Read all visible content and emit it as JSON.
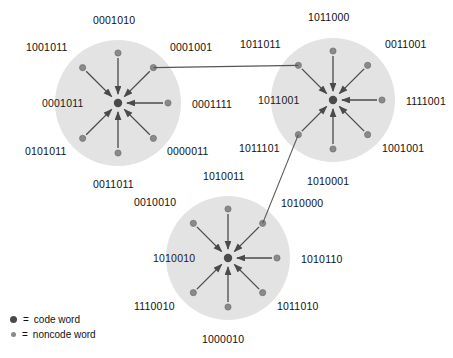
{
  "figure": {
    "colors": {
      "sphere_fill": "#e2e2e2",
      "codeword_dot": "#4a4a4a",
      "noncode_dot": "#8a8a8a",
      "arrow": "#4a4a4a",
      "link_line": "#555555",
      "text": "#111111"
    }
  },
  "spheres": [
    {
      "id": "sphere-1",
      "center_label": "0001011",
      "center_label_pos": {
        "x": 42,
        "y": 97
      },
      "cx": 118,
      "cy": 103,
      "r": 63,
      "neighbors": [
        {
          "bits": "0001010",
          "angle": -90,
          "label_x": 93,
          "label_y": 14,
          "label_align": "left"
        },
        {
          "bits": "0001001",
          "angle": -45,
          "label_x": 170,
          "label_y": 41,
          "label_align": "left"
        },
        {
          "bits": "0001111",
          "angle": 0,
          "label_x": 192,
          "label_y": 98,
          "label_align": "left"
        },
        {
          "bits": "0000011",
          "angle": 45,
          "label_x": 167,
          "label_y": 145,
          "label_align": "left"
        },
        {
          "bits": "0011011",
          "angle": 90,
          "label_x": 93,
          "label_y": 178,
          "label_align": "left"
        },
        {
          "bits": "0101011",
          "angle": 135,
          "label_x": 25,
          "label_y": 145,
          "label_align": "left"
        },
        {
          "bits": "1001011",
          "angle": -135,
          "label_x": 26,
          "label_y": 41,
          "label_align": "left"
        }
      ]
    },
    {
      "id": "sphere-2",
      "center_label": "1011001",
      "center_label_pos": {
        "x": 258,
        "y": 94
      },
      "cx": 333,
      "cy": 100,
      "r": 62,
      "neighbors": [
        {
          "bits": "1011000",
          "angle": -90,
          "label_x": 308,
          "label_y": 11,
          "label_align": "left"
        },
        {
          "bits": "0011001",
          "angle": -45,
          "label_x": 385,
          "label_y": 38,
          "label_align": "left"
        },
        {
          "bits": "1111001",
          "angle": 0,
          "label_x": 406,
          "label_y": 95,
          "label_align": "left"
        },
        {
          "bits": "1001001",
          "angle": 45,
          "label_x": 382,
          "label_y": 142,
          "label_align": "left"
        },
        {
          "bits": "1010001",
          "angle": 90,
          "label_x": 307,
          "label_y": 175,
          "label_align": "left"
        },
        {
          "bits": "1011101",
          "angle": 135,
          "label_x": 239,
          "label_y": 142,
          "label_align": "left"
        },
        {
          "bits": "1011011",
          "angle": -135,
          "label_x": 240,
          "label_y": 38,
          "label_align": "left"
        }
      ]
    },
    {
      "id": "sphere-3",
      "center_label": "1010010",
      "center_label_pos": {
        "x": 153,
        "y": 252
      },
      "cx": 228,
      "cy": 258,
      "r": 62,
      "neighbors": [
        {
          "bits": "1010011",
          "angle": -90,
          "label_x": 203,
          "label_y": 170,
          "label_align": "left"
        },
        {
          "bits": "1010000",
          "angle": -45,
          "label_x": 281,
          "label_y": 197,
          "label_align": "left"
        },
        {
          "bits": "1010110",
          "angle": 0,
          "label_x": 301,
          "label_y": 253,
          "label_align": "left"
        },
        {
          "bits": "1011010",
          "angle": 45,
          "label_x": 277,
          "label_y": 300,
          "label_align": "left"
        },
        {
          "bits": "1000010",
          "angle": 90,
          "label_x": 202,
          "label_y": 333,
          "label_align": "left"
        },
        {
          "bits": "1110010",
          "angle": 135,
          "label_x": 134,
          "label_y": 300,
          "label_align": "left"
        },
        {
          "bits": "0010010",
          "angle": -135,
          "label_x": 134,
          "label_y": 196,
          "label_align": "left"
        }
      ]
    }
  ],
  "links": [
    {
      "id": "link-sphere1-sphere2",
      "from": "0001001",
      "to": "1011011"
    },
    {
      "id": "link-sphere2-sphere3",
      "from": "1011101",
      "to": "1010000"
    }
  ],
  "legend": {
    "items": [
      {
        "id": "legend-codeword",
        "marker": "code-word-dot",
        "equals": "=",
        "label": "code word"
      },
      {
        "id": "legend-noncode",
        "marker": "noncode-word-dot",
        "equals": "=",
        "label": "noncode word"
      }
    ],
    "pos": {
      "x": 10,
      "y": 312
    }
  }
}
